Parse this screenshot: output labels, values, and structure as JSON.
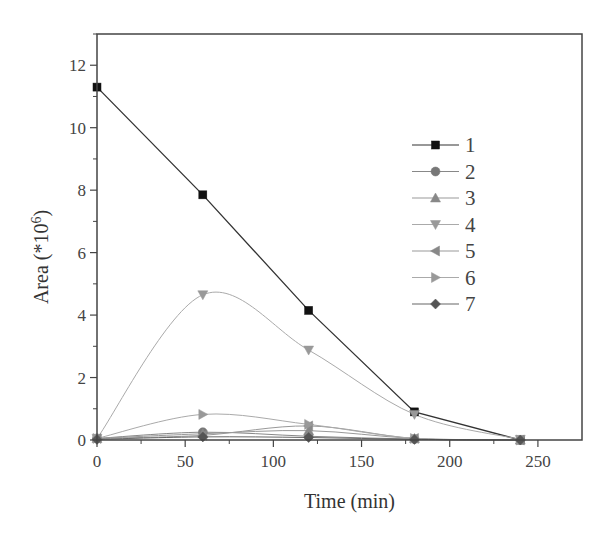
{
  "chart_data": {
    "type": "line",
    "title": "",
    "xlabel": "Time (min)",
    "ylabel": "Area (*10^6)",
    "ylabel_base": "Area (*10",
    "ylabel_sup": "6",
    "ylabel_close": ")",
    "xlim": [
      0,
      275
    ],
    "ylim": [
      0,
      13
    ],
    "xticks": [
      0,
      50,
      100,
      150,
      200,
      250
    ],
    "yticks": [
      0,
      2,
      4,
      6,
      8,
      10,
      12
    ],
    "grid": false,
    "legend_position": "upper right (inside)",
    "x": [
      0,
      60,
      120,
      180,
      240
    ],
    "series": [
      {
        "name": "1",
        "marker": "square",
        "color": "#111111",
        "line_color": "#333333",
        "values": [
          11.3,
          7.85,
          4.15,
          0.9,
          0.0
        ]
      },
      {
        "name": "2",
        "marker": "circle",
        "color": "#777777",
        "line_color": "#888888",
        "values": [
          0.05,
          0.25,
          0.12,
          0.03,
          0.0
        ]
      },
      {
        "name": "3",
        "marker": "triangle-up",
        "color": "#888888",
        "line_color": "#999999",
        "values": [
          0.05,
          0.2,
          0.3,
          0.05,
          0.0
        ]
      },
      {
        "name": "4",
        "marker": "triangle-down",
        "color": "#999999",
        "line_color": "#aaaaaa",
        "values": [
          0.05,
          4.65,
          2.88,
          0.82,
          0.02
        ]
      },
      {
        "name": "5",
        "marker": "triangle-left",
        "color": "#888888",
        "line_color": "#999999",
        "values": [
          0.05,
          0.15,
          0.45,
          0.05,
          0.0
        ]
      },
      {
        "name": "6",
        "marker": "triangle-right",
        "color": "#999999",
        "line_color": "#aaaaaa",
        "values": [
          0.05,
          0.82,
          0.5,
          0.05,
          0.0
        ]
      },
      {
        "name": "7",
        "marker": "diamond",
        "color": "#555555",
        "line_color": "#666666",
        "values": [
          0.02,
          0.1,
          0.08,
          0.02,
          0.0
        ]
      }
    ]
  }
}
